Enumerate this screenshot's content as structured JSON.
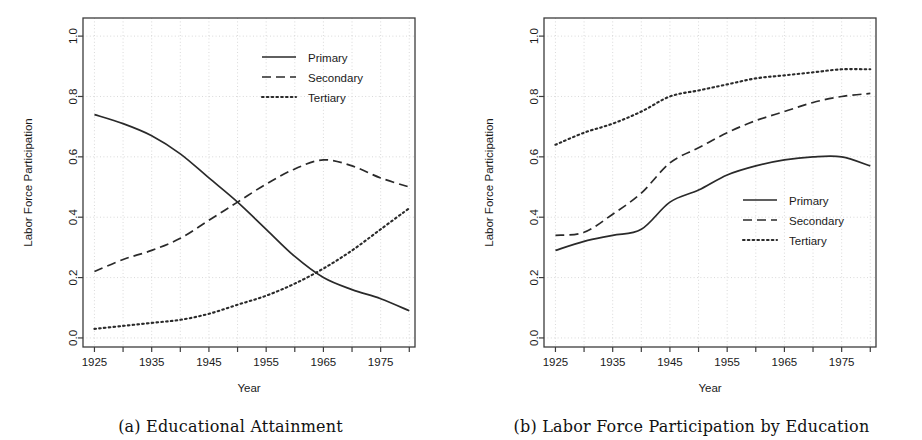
{
  "figure": {
    "panels": [
      {
        "id": "a",
        "caption": "(a) Educational Attainment",
        "axes": {
          "xlabel": "Year",
          "ylabel": "Labor Force Participation",
          "xticks": [
            1925,
            1935,
            1945,
            1955,
            1965,
            1975
          ],
          "xtick_labels": [
            "1925",
            "1935",
            "1945",
            "1955",
            "1965",
            "1975"
          ],
          "xminor": [
            1930,
            1940,
            1950,
            1960,
            1970,
            1980
          ],
          "yticks": [
            0.0,
            0.2,
            0.4,
            0.6,
            0.8,
            1.0
          ],
          "ytick_labels": [
            "0.0",
            "0.2",
            "0.4",
            "0.6",
            "0.8",
            "1.0"
          ],
          "xlim": [
            1923,
            1981
          ],
          "ylim": [
            -0.03,
            1.06
          ]
        },
        "legend": {
          "position": "top-right",
          "entries": [
            {
              "label": "Primary",
              "style": "solid"
            },
            {
              "label": "Secondary",
              "style": "dashed"
            },
            {
              "label": "Tertiary",
              "style": "dotted"
            }
          ]
        }
      },
      {
        "id": "b",
        "caption": "(b) Labor Force Participation by Education",
        "axes": {
          "xlabel": "Year",
          "ylabel": "Labor Force Participation",
          "xticks": [
            1925,
            1935,
            1945,
            1955,
            1965,
            1975
          ],
          "xtick_labels": [
            "1925",
            "1935",
            "1945",
            "1955",
            "1965",
            "1975"
          ],
          "xminor": [
            1930,
            1940,
            1950,
            1960,
            1970,
            1980
          ],
          "yticks": [
            0.0,
            0.2,
            0.4,
            0.6,
            0.8,
            1.0
          ],
          "ytick_labels": [
            "0.0",
            "0.2",
            "0.4",
            "0.6",
            "0.8",
            "1.0"
          ],
          "xlim": [
            1923,
            1981
          ],
          "ylim": [
            -0.03,
            1.06
          ]
        },
        "legend": {
          "position": "middle-right",
          "entries": [
            {
              "label": "Primary",
              "style": "solid"
            },
            {
              "label": "Secondary",
              "style": "dashed"
            },
            {
              "label": "Tertiary",
              "style": "dotted"
            }
          ]
        }
      }
    ]
  },
  "colors": {
    "line": "#2a2a2a",
    "frame": "#3c3c3c",
    "grid": "#cfcfcf",
    "background": "#ffffff"
  },
  "chart_data": [
    {
      "type": "line",
      "title": "(a) Educational Attainment",
      "xlabel": "Year",
      "ylabel": "Labor Force Participation",
      "xlim": [
        1923,
        1981
      ],
      "ylim": [
        0.0,
        1.0
      ],
      "grid": true,
      "legend_position": "top-right",
      "x": [
        1925,
        1930,
        1935,
        1940,
        1945,
        1950,
        1955,
        1960,
        1965,
        1970,
        1975,
        1980
      ],
      "series": [
        {
          "name": "Primary",
          "style": "solid",
          "values": [
            0.74,
            0.71,
            0.67,
            0.61,
            0.53,
            0.45,
            0.36,
            0.27,
            0.2,
            0.16,
            0.13,
            0.09
          ]
        },
        {
          "name": "Secondary",
          "style": "dashed",
          "values": [
            0.22,
            0.26,
            0.29,
            0.33,
            0.39,
            0.45,
            0.51,
            0.56,
            0.59,
            0.57,
            0.53,
            0.5
          ]
        },
        {
          "name": "Tertiary",
          "style": "dotted",
          "values": [
            0.03,
            0.04,
            0.05,
            0.06,
            0.08,
            0.11,
            0.14,
            0.18,
            0.23,
            0.29,
            0.36,
            0.43
          ]
        }
      ]
    },
    {
      "type": "line",
      "title": "(b) Labor Force Participation by Education",
      "xlabel": "Year",
      "ylabel": "Labor Force Participation",
      "xlim": [
        1923,
        1981
      ],
      "ylim": [
        0.0,
        1.0
      ],
      "grid": true,
      "legend_position": "middle-right",
      "x": [
        1925,
        1930,
        1935,
        1940,
        1945,
        1950,
        1955,
        1960,
        1965,
        1970,
        1975,
        1980
      ],
      "series": [
        {
          "name": "Primary",
          "style": "solid",
          "values": [
            0.29,
            0.32,
            0.34,
            0.36,
            0.45,
            0.49,
            0.54,
            0.57,
            0.59,
            0.6,
            0.6,
            0.57
          ]
        },
        {
          "name": "Secondary",
          "style": "dashed",
          "values": [
            0.34,
            0.35,
            0.41,
            0.48,
            0.58,
            0.63,
            0.68,
            0.72,
            0.75,
            0.78,
            0.8,
            0.81
          ]
        },
        {
          "name": "Tertiary",
          "style": "dotted",
          "values": [
            0.64,
            0.68,
            0.71,
            0.75,
            0.8,
            0.82,
            0.84,
            0.86,
            0.87,
            0.88,
            0.89,
            0.89
          ]
        }
      ]
    }
  ]
}
